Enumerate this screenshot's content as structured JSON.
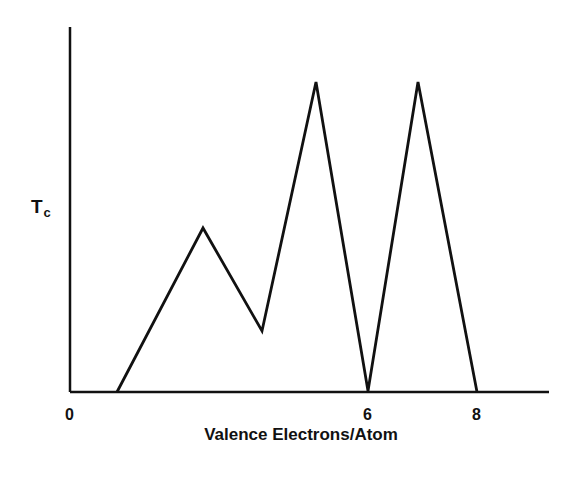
{
  "chart_data": {
    "type": "line",
    "title": "",
    "xlabel": "Valence Electrons/Atom",
    "ylabel": "T",
    "ylabel_subscript": "c",
    "x_ticks": [
      {
        "value": 0,
        "label": "0"
      },
      {
        "value": 6,
        "label": "6"
      },
      {
        "value": 8,
        "label": "8"
      }
    ],
    "y_ticks": [],
    "xlim": [
      0,
      9
    ],
    "ylim": [
      0,
      1.1
    ],
    "grid": false,
    "legend": null,
    "series": [
      {
        "name": "Tc",
        "x": [
          0.95,
          2.7,
          3.9,
          5.0,
          6.0,
          7.0,
          8.0
        ],
        "y": [
          0.0,
          0.53,
          0.2,
          1.0,
          0.0,
          1.0,
          0.0
        ]
      }
    ]
  },
  "colors": {
    "line": "#111111",
    "background": "#ffffff"
  },
  "layout": {
    "origin_px": [
      70,
      392
    ],
    "axis_top_px": 27,
    "axis_right_px": 549,
    "points_px": [
      [
        117,
        392
      ],
      [
        203,
        228
      ],
      [
        262,
        331
      ],
      [
        316,
        82
      ],
      [
        368,
        391
      ],
      [
        418,
        82
      ],
      [
        477,
        392
      ]
    ],
    "tick_px": [
      70,
      368,
      477
    ]
  }
}
